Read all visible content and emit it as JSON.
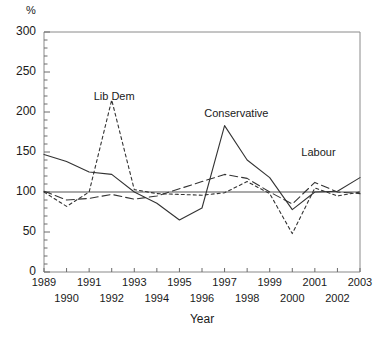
{
  "chart_data": {
    "type": "line",
    "title": "",
    "xlabel": "Year",
    "ylabel": "%",
    "ylim": [
      0,
      300
    ],
    "yticks": [
      0,
      50,
      100,
      150,
      200,
      250,
      300
    ],
    "yminor_step": 10,
    "grid": false,
    "legend_position": "inline-annotations",
    "reference_line": 100,
    "x": [
      1989,
      1990,
      1991,
      1992,
      1993,
      1994,
      1995,
      1996,
      1997,
      1998,
      1999,
      2000,
      2001,
      2002,
      2003
    ],
    "xticklabels": [
      "1989",
      "1990",
      "1991",
      "1992",
      "1993",
      "1994",
      "1995",
      "1996",
      "1997",
      "1998",
      "1999",
      "2000",
      "2001",
      "2002",
      "2003"
    ],
    "series": [
      {
        "name": "Conservative",
        "style": "solid",
        "color": "#333333",
        "values": [
          147,
          138,
          125,
          122,
          100,
          86,
          65,
          80,
          183,
          140,
          118,
          78,
          100,
          101,
          118
        ]
      },
      {
        "name": "Lib Dem",
        "style": "short-dash",
        "color": "#333333",
        "values": [
          100,
          82,
          100,
          215,
          103,
          98,
          97,
          96,
          99,
          113,
          98,
          48,
          105,
          95,
          100
        ]
      },
      {
        "name": "Labour",
        "style": "long-dash",
        "color": "#333333",
        "values": [
          101,
          90,
          92,
          97,
          91,
          95,
          104,
          113,
          122,
          117,
          100,
          85,
          112,
          100,
          98
        ]
      }
    ],
    "annotations": [
      {
        "text": "Lib Dem",
        "x": 1991.2,
        "y": 218
      },
      {
        "text": "Conservative",
        "x": 1996.1,
        "y": 196
      },
      {
        "text": "Labour",
        "x": 2000.4,
        "y": 148
      }
    ]
  },
  "axis": {
    "y_unit": "%",
    "x_title": "Year"
  }
}
